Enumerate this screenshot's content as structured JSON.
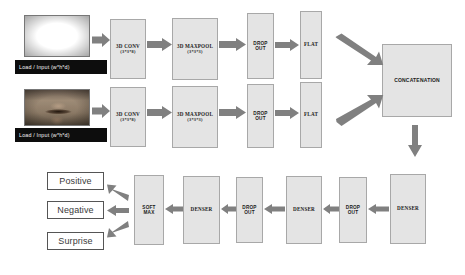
{
  "diagram": {
    "colors": {
      "box_fill": "#e4e4e4",
      "box_border": "#a8a8a8",
      "arrow": "#808080",
      "caption_bg": "#0d0d0d",
      "caption_text": "#f2f2f2",
      "label_border": "#555555"
    },
    "inputs": [
      {
        "id": "eyes",
        "image_name": "eye-region-face-crop",
        "caption": "Load / Input (w*h*d)"
      },
      {
        "id": "mouth",
        "image_name": "mouth-region-face-crop",
        "caption": "Load / Input (w*h*d)"
      }
    ],
    "streams": [
      {
        "id": "top-stream",
        "blocks": [
          {
            "name": "conv",
            "label": "3D CONV",
            "sub": "(3*3*8)"
          },
          {
            "name": "maxpool",
            "label": "3D MAXPOOL",
            "sub": "(3*3*3)"
          },
          {
            "name": "dropout",
            "label": "DROP",
            "sub": "OUT"
          },
          {
            "name": "flat",
            "label": "FLAT",
            "sub": ""
          }
        ]
      },
      {
        "id": "bottom-stream",
        "blocks": [
          {
            "name": "conv",
            "label": "3D CONV",
            "sub": "(3*3*8)"
          },
          {
            "name": "maxpool",
            "label": "3D MAXPOOL",
            "sub": "(3*3*3)"
          },
          {
            "name": "dropout",
            "label": "DROP",
            "sub": "OUT"
          },
          {
            "name": "flat",
            "label": "FLAT",
            "sub": ""
          }
        ]
      }
    ],
    "merge": {
      "label": "CONCATENATION"
    },
    "head": [
      {
        "name": "denser-3",
        "label": "DENSER",
        "sub": ""
      },
      {
        "name": "dropout-3",
        "label": "DROP",
        "sub": "OUT"
      },
      {
        "name": "denser-2",
        "label": "DENSER",
        "sub": ""
      },
      {
        "name": "dropout-2",
        "label": "DROP",
        "sub": "OUT"
      },
      {
        "name": "denser-1",
        "label": "DENSER",
        "sub": ""
      },
      {
        "name": "softmax",
        "label": "SOFT",
        "sub": "MAX"
      }
    ],
    "outputs": [
      {
        "label": "Positive"
      },
      {
        "label": "Negative"
      },
      {
        "label": "Surprise"
      }
    ]
  }
}
